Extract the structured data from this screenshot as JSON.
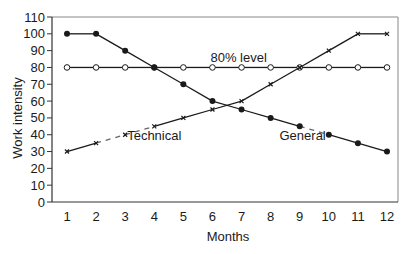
{
  "chart_data": {
    "type": "line",
    "title": "",
    "xlabel": "Months",
    "ylabel": "Work intensity",
    "x": [
      1,
      2,
      3,
      4,
      5,
      6,
      7,
      8,
      9,
      10,
      11,
      12
    ],
    "xlim": [
      0.5,
      12.4
    ],
    "ylim": [
      0,
      110
    ],
    "yticks": [
      0,
      10,
      20,
      30,
      40,
      50,
      60,
      70,
      80,
      90,
      100,
      110
    ],
    "grid": false,
    "legend": "inline annotations",
    "series": [
      {
        "name": "80% level",
        "marker": "open-circle",
        "values": [
          80,
          80,
          80,
          80,
          80,
          80,
          80,
          80,
          80,
          80,
          80,
          80
        ]
      },
      {
        "name": "General",
        "marker": "filled-circle",
        "values": [
          100,
          100,
          90,
          80,
          70,
          60,
          55,
          50,
          45,
          40,
          35,
          30
        ]
      },
      {
        "name": "Technical",
        "marker": "tick",
        "values": [
          30,
          35,
          40,
          45,
          50,
          55,
          60,
          70,
          80,
          90,
          100,
          100
        ]
      }
    ],
    "annotations": [
      {
        "text": "80% level",
        "x": 6.9,
        "y": 83
      },
      {
        "text": "Technical",
        "x": 4.0,
        "y": 37
      },
      {
        "text": "General",
        "x": 9.1,
        "y": 37
      }
    ]
  },
  "colors": {
    "line": "#1a1a1a",
    "axis": "#333333",
    "frame": "#888888"
  }
}
